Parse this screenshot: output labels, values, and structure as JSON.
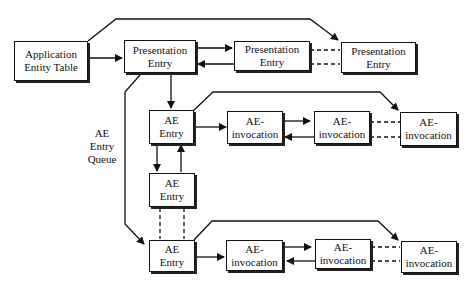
{
  "diagram": {
    "nodes": {
      "aet": {
        "line1": "Application",
        "line2": "Entity Table"
      },
      "pe1": {
        "line1": "Presentation",
        "line2": "Entry"
      },
      "pe2": {
        "line1": "Presentation",
        "line2": "Entry"
      },
      "pe3": {
        "line1": "Presentation",
        "line2": "Entry"
      },
      "ae1": {
        "line1": "AE",
        "line2": "Entry"
      },
      "ae2": {
        "line1": "AE",
        "line2": "Entry"
      },
      "ae3": {
        "line1": "AE",
        "line2": "Entry"
      },
      "inv1a": {
        "line1": "AE-",
        "line2": "invocation"
      },
      "inv1b": {
        "line1": "AE-",
        "line2": "invocation"
      },
      "inv1c": {
        "line1": "AE-",
        "line2": "invocation"
      },
      "inv3a": {
        "line1": "AE-",
        "line2": "invocation"
      },
      "inv3b": {
        "line1": "AE-",
        "line2": "invocation"
      },
      "inv3c": {
        "line1": "AE-",
        "line2": "invocation"
      }
    },
    "labels": {
      "queue": {
        "line1": "AE",
        "line2": "Entry",
        "line3": "Queue"
      }
    },
    "colors": {
      "line": "#111111",
      "box_fill": "#ffffff",
      "shadow": "#222222"
    }
  }
}
